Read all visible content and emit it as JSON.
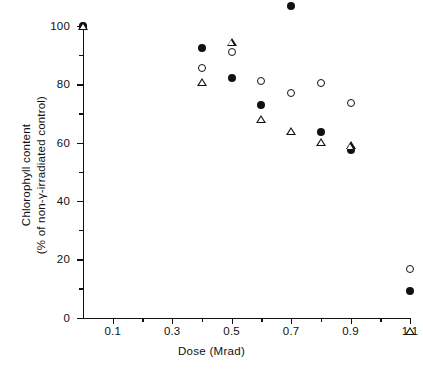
{
  "chart_data": {
    "type": "scatter",
    "title": "",
    "xlabel": "Dose   (Mrad)",
    "ylabel_line1": "Chlorophyll content",
    "ylabel_line2": "(% of non-γ-irradiated control)",
    "xlim": [
      0,
      1.1
    ],
    "ylim": [
      0,
      100
    ],
    "xticks": [
      0.1,
      0.3,
      0.5,
      0.7,
      0.9,
      1.1
    ],
    "xtick_labels": [
      "0.1",
      "0.3",
      "0.5",
      "0.7",
      "0.9",
      "1.1"
    ],
    "xticks_minor": [
      0.2,
      0.4,
      0.6,
      0.8,
      1.0
    ],
    "yticks": [
      0,
      20,
      40,
      60,
      80,
      100
    ],
    "ytick_labels": [
      "0",
      "20",
      "40",
      "60",
      "80",
      "100"
    ],
    "yticks_minor": [
      10,
      30,
      50,
      70,
      90
    ],
    "grid": false,
    "legend": "none",
    "series": [
      {
        "name": "filled-circle",
        "marker": "filled-circle",
        "points": [
          {
            "x": 0.0,
            "y": 100.0
          },
          {
            "x": 0.4,
            "y": 92.5
          },
          {
            "x": 0.5,
            "y": 82.0
          },
          {
            "x": 0.6,
            "y": 73.0
          },
          {
            "x": 0.7,
            "y": 107.0
          },
          {
            "x": 0.8,
            "y": 63.5
          },
          {
            "x": 0.9,
            "y": 57.5
          },
          {
            "x": 1.1,
            "y": 9.0
          }
        ]
      },
      {
        "name": "open-circle",
        "marker": "open-circle",
        "points": [
          {
            "x": 0.0,
            "y": 100.0
          },
          {
            "x": 0.4,
            "y": 85.5
          },
          {
            "x": 0.5,
            "y": 91.0
          },
          {
            "x": 0.6,
            "y": 81.0
          },
          {
            "x": 0.7,
            "y": 77.0
          },
          {
            "x": 0.8,
            "y": 80.5
          },
          {
            "x": 0.9,
            "y": 73.5
          },
          {
            "x": 1.1,
            "y": 16.5
          }
        ]
      },
      {
        "name": "open-triangle",
        "marker": "open-triangle",
        "points": [
          {
            "x": 0.0,
            "y": 100.0
          },
          {
            "x": 0.4,
            "y": 83.5
          },
          {
            "x": 0.5,
            "y": 100.0
          },
          {
            "x": 0.6,
            "y": 76.5
          },
          {
            "x": 0.7,
            "y": 75.0
          },
          {
            "x": 0.8,
            "y": 74.0
          },
          {
            "x": 0.9,
            "y": 75.5
          },
          {
            "x": 1.1,
            "y": 14.5
          }
        ]
      }
    ]
  },
  "colors": {
    "ink": "#111111",
    "background": "#ffffff"
  }
}
